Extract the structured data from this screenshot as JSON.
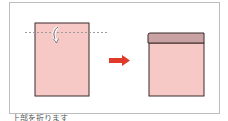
{
  "diagram": {
    "type": "folding-instruction",
    "steps": [
      {
        "name": "before-fold",
        "shape": "rectangle",
        "fold_line": "dashed",
        "fold_direction": "down",
        "fill": "#f6c9c6",
        "stroke": "#3a2a2a"
      },
      {
        "name": "after-fold",
        "shape": "rectangle-with-folded-flap",
        "fill": "#f6c9c6",
        "flap_fill": "#c9a3a3",
        "stroke": "#3a2a2a"
      }
    ],
    "transition_arrow": {
      "direction": "right",
      "color": "#e03a2a"
    },
    "fold_line_color": "#a09a9a",
    "frame_border_color": "#bdbdbd"
  },
  "caption": {
    "text": "上部を折ります"
  }
}
